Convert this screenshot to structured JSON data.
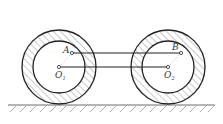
{
  "diagram": {
    "type": "mechanism",
    "colors": {
      "stroke": "#222222",
      "hatch": "#666666",
      "background": "#ffffff"
    },
    "labels": {
      "point_a": "A",
      "point_b": "B",
      "center_1": "O",
      "center_1_sub": "1",
      "center_2": "O",
      "center_2_sub": "2"
    },
    "wheels": [
      {
        "name": "left-wheel",
        "cx": 59,
        "cy": 67,
        "outer_r": 37,
        "inner_r": 26
      },
      {
        "name": "right-wheel",
        "cx": 168,
        "cy": 67,
        "outer_r": 37,
        "inner_r": 26
      }
    ],
    "rods": [
      {
        "name": "rod-AB",
        "from": "A",
        "to": "B"
      },
      {
        "name": "rod-O1O2",
        "from": "O1",
        "to": "O2"
      }
    ],
    "ground": {
      "y": 105,
      "x1": 8,
      "x2": 215
    }
  }
}
